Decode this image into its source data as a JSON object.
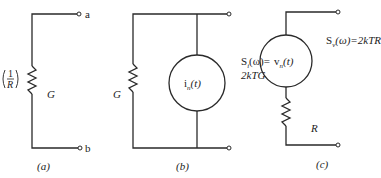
{
  "figure": {
    "panels": [
      {
        "id": "a",
        "caption": "(a)",
        "terminals": [
          "a",
          "b"
        ],
        "resistor_label": "G",
        "side_label_numerator": "1",
        "side_label_denominator": "R"
      },
      {
        "id": "b",
        "caption": "(b)",
        "resistor_label": "G",
        "source_label": "i",
        "source_subscript": "n",
        "source_arg": "(t)",
        "psd_line1": "S",
        "psd_sub": "i",
        "psd_line1_rest": "(ω)=",
        "psd_line2": "2kTG"
      },
      {
        "id": "c",
        "caption": "(c)",
        "resistor_label": "R",
        "source_label": "v",
        "source_subscript": "n",
        "source_arg": "(t)",
        "psd_prefix": "S",
        "psd_sub": "v",
        "psd_rest": "(ω)=2kTR"
      }
    ]
  }
}
